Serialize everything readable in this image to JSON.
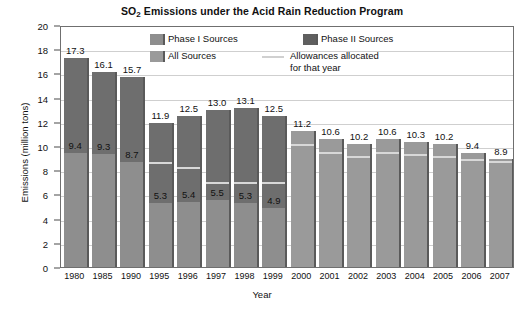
{
  "chart_data": {
    "type": "bar",
    "title": "SO2 Emissions under the Acid Rain Reduction Program",
    "title_main": "SO",
    "title_sub": "2",
    "title_rest": " Emissions under the Acid Rain Reduction Program",
    "xlabel": "Year",
    "ylabel": "Emissions (million tons)",
    "ylim": [
      0,
      20
    ],
    "ytick_step": 2,
    "yticks": [
      "0",
      "2",
      "4",
      "6",
      "8",
      "10",
      "12",
      "14",
      "16",
      "18",
      "20"
    ],
    "grid": true,
    "legend_position": "top-center-inside",
    "stacked": true,
    "categories": [
      "1980",
      "1985",
      "1990",
      "1995",
      "1996",
      "1997",
      "1998",
      "1999",
      "2000",
      "2001",
      "2002",
      "2003",
      "2004",
      "2005",
      "2006",
      "2007"
    ],
    "series": [
      {
        "name": "Phase I Sources",
        "values": [
          9.4,
          9.3,
          8.7,
          5.3,
          5.4,
          5.5,
          5.3,
          4.9,
          null,
          null,
          null,
          null,
          null,
          null,
          null,
          null
        ]
      },
      {
        "name": "Phase II Sources",
        "values": [
          7.9,
          6.8,
          7.0,
          6.6,
          7.1,
          7.5,
          7.8,
          7.6,
          null,
          null,
          null,
          null,
          null,
          null,
          null,
          null
        ]
      },
      {
        "name": "All Sources",
        "values": [
          null,
          null,
          null,
          null,
          null,
          null,
          null,
          null,
          11.2,
          10.6,
          10.2,
          10.6,
          10.3,
          10.2,
          9.4,
          8.9
        ]
      }
    ],
    "totals": [
      17.3,
      16.1,
      15.7,
      11.9,
      12.5,
      13.0,
      13.1,
      12.5,
      11.2,
      10.6,
      10.2,
      10.6,
      10.3,
      10.2,
      9.4,
      8.9
    ],
    "total_labels": [
      "17.3",
      "16.1",
      "15.7",
      "11.9",
      "12.5",
      "13.0",
      "13.1",
      "12.5",
      "11.2",
      "10.6",
      "10.2",
      "10.6",
      "10.3",
      "10.2",
      "9.4",
      "8.9"
    ],
    "phase1_labels": [
      "9.4",
      "9.3",
      "8.7",
      "5.3",
      "5.4",
      "5.5",
      "5.3",
      "4.9",
      "",
      "",
      "",
      "",
      "",
      "",
      "",
      ""
    ],
    "allowances": [
      null,
      null,
      null,
      8.7,
      8.3,
      7.0,
      7.0,
      7.0,
      10.2,
      9.5,
      9.2,
      9.5,
      9.3,
      9.2,
      8.9,
      8.8
    ],
    "bars": [
      {
        "year": "1980",
        "total": 17.3,
        "total_label": "17.3",
        "phase1": 9.4,
        "phase1_label": "9.4",
        "phase2": 7.9,
        "all": null,
        "allowance": null
      },
      {
        "year": "1985",
        "total": 16.1,
        "total_label": "16.1",
        "phase1": 9.3,
        "phase1_label": "9.3",
        "phase2": 6.8,
        "all": null,
        "allowance": null
      },
      {
        "year": "1990",
        "total": 15.7,
        "total_label": "15.7",
        "phase1": 8.7,
        "phase1_label": "8.7",
        "phase2": 7.0,
        "all": null,
        "allowance": null
      },
      {
        "year": "1995",
        "total": 11.9,
        "total_label": "11.9",
        "phase1": 5.3,
        "phase1_label": "5.3",
        "phase2": 6.6,
        "all": null,
        "allowance": 8.7
      },
      {
        "year": "1996",
        "total": 12.5,
        "total_label": "12.5",
        "phase1": 5.4,
        "phase1_label": "5.4",
        "phase2": 7.1,
        "all": null,
        "allowance": 8.3
      },
      {
        "year": "1997",
        "total": 13.0,
        "total_label": "13.0",
        "phase1": 5.5,
        "phase1_label": "5.5",
        "phase2": 7.5,
        "all": null,
        "allowance": 7.0
      },
      {
        "year": "1998",
        "total": 13.1,
        "total_label": "13.1",
        "phase1": 5.3,
        "phase1_label": "5.3",
        "phase2": 7.8,
        "all": null,
        "allowance": 7.0
      },
      {
        "year": "1999",
        "total": 12.5,
        "total_label": "12.5",
        "phase1": 4.9,
        "phase1_label": "4.9",
        "phase2": 7.6,
        "all": null,
        "allowance": 7.0
      },
      {
        "year": "2000",
        "total": 11.2,
        "total_label": "11.2",
        "phase1": null,
        "phase1_label": "",
        "phase2": null,
        "all": 11.2,
        "allowance": 10.2
      },
      {
        "year": "2001",
        "total": 10.6,
        "total_label": "10.6",
        "phase1": null,
        "phase1_label": "",
        "phase2": null,
        "all": 10.6,
        "allowance": 9.5
      },
      {
        "year": "2002",
        "total": 10.2,
        "total_label": "10.2",
        "phase1": null,
        "phase1_label": "",
        "phase2": null,
        "all": 10.2,
        "allowance": 9.2
      },
      {
        "year": "2003",
        "total": 10.6,
        "total_label": "10.6",
        "phase1": null,
        "phase1_label": "",
        "phase2": null,
        "all": 10.6,
        "allowance": 9.5
      },
      {
        "year": "2004",
        "total": 10.3,
        "total_label": "10.3",
        "phase1": null,
        "phase1_label": "",
        "phase2": null,
        "all": 10.3,
        "allowance": 9.3
      },
      {
        "year": "2005",
        "total": 10.2,
        "total_label": "10.2",
        "phase1": null,
        "phase1_label": "",
        "phase2": null,
        "all": 10.2,
        "allowance": 9.2
      },
      {
        "year": "2006",
        "total": 9.4,
        "total_label": "9.4",
        "phase1": null,
        "phase1_label": "",
        "phase2": null,
        "all": 9.4,
        "allowance": 8.9
      },
      {
        "year": "2007",
        "total": 8.9,
        "total_label": "8.9",
        "phase1": null,
        "phase1_label": "",
        "phase2": null,
        "all": 8.9,
        "allowance": 8.8
      }
    ],
    "legend": [
      {
        "label": "Phase I Sources",
        "type": "swatch",
        "color": "#8e8e8e"
      },
      {
        "label": "Phase II Sources",
        "type": "swatch",
        "color": "#5f5f5f"
      },
      {
        "label": "All Sources",
        "type": "swatch",
        "color": "#9a9a9a"
      },
      {
        "label": "Allowances allocated",
        "label_line2": "for that year",
        "type": "line",
        "color": "#d0d0d0"
      }
    ],
    "colors": {
      "phase1": "#8e8e8e",
      "phase2": "#6e6e6e",
      "all": "#9a9a9a",
      "allowance_line": "#d8d8d8",
      "grid": "#cfcfcf",
      "frame": "#6f6f6f",
      "background": "#ffffff",
      "text": "#111111"
    }
  }
}
